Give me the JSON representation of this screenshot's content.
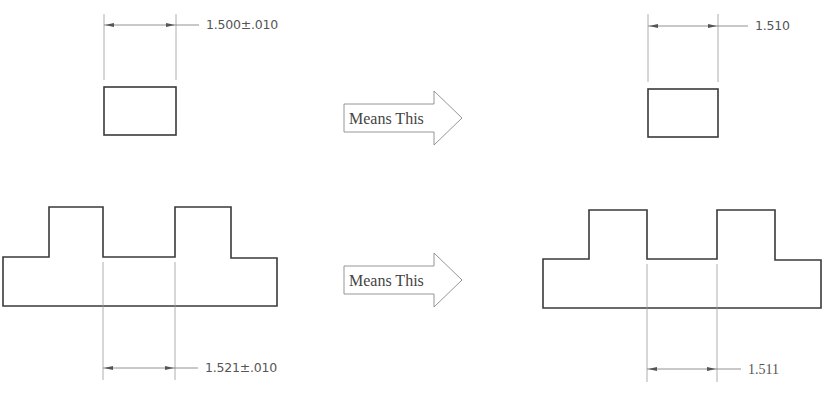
{
  "diagram": {
    "type": "tolerance-interpretation",
    "examples": [
      {
        "id": "single-rectangle",
        "left": {
          "dimension_label": "1.500±.010",
          "nominal": "1.500",
          "tolerance": "±.010"
        },
        "arrow_label": "Means This",
        "right": {
          "dimension_label": "1.510"
        }
      },
      {
        "id": "stepped-part",
        "left": {
          "dimension_label": "1.521±.010",
          "nominal": "1.521",
          "tolerance": "±.010"
        },
        "arrow_label": "Means This",
        "right": {
          "dimension_label": "1.511"
        }
      }
    ],
    "colors": {
      "outline": "#3a3a3a",
      "extension_line": "#9a9a9a",
      "dimension_text": "#555555",
      "arrow_outline": "#8a8a8a"
    }
  }
}
